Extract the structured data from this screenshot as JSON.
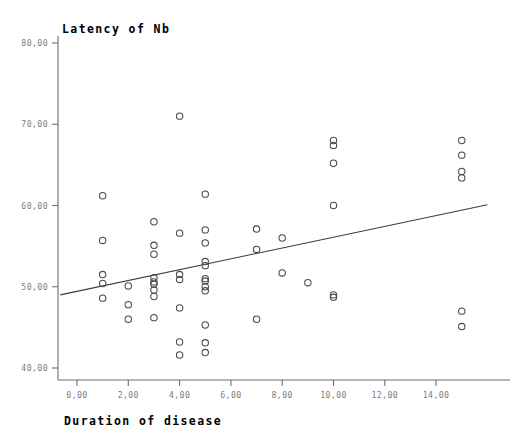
{
  "chart": {
    "type": "scatter",
    "title": "Latency of Nb",
    "xlabel": "Duration of disease",
    "ylabel": "Latency of Nb"
  },
  "chart_data": {
    "type": "scatter",
    "title": "Latency of Nb",
    "subtitle": "",
    "xlabel": "Duration of disease",
    "ylabel": "Latency of Nb",
    "xlim": [
      -0.65,
      16.0
    ],
    "ylim": [
      38.0,
      81.5
    ],
    "xticks": [
      0,
      2,
      4,
      6,
      8,
      10,
      12,
      14
    ],
    "xtick_labels": [
      "0,00",
      "2,00",
      "4,00",
      "6,00",
      "8,00",
      "10,00",
      "12,00",
      "14,00"
    ],
    "yticks": [
      40,
      50,
      60,
      70,
      80
    ],
    "ytick_labels": [
      "40,00",
      "50,00",
      "60,00",
      "70,00",
      "80,00"
    ],
    "grid": false,
    "legend": null,
    "marker": "open-circle",
    "marker_color": "#4a4a4a",
    "axis_color": "#6f6f6f",
    "tick_label_color": "#7d7d7d",
    "decimal_separator": ",",
    "series": [
      {
        "name": "Observations",
        "points": [
          [
            1,
            61.2
          ],
          [
            1,
            55.7
          ],
          [
            1,
            51.5
          ],
          [
            1,
            50.4
          ],
          [
            1,
            48.6
          ],
          [
            2,
            50.1
          ],
          [
            2,
            47.8
          ],
          [
            2,
            46.0
          ],
          [
            3,
            58.0
          ],
          [
            3,
            55.1
          ],
          [
            3,
            54.0
          ],
          [
            3,
            51.1
          ],
          [
            3,
            50.6
          ],
          [
            3,
            50.3
          ],
          [
            3,
            49.6
          ],
          [
            3,
            48.8
          ],
          [
            3,
            46.2
          ],
          [
            4,
            71.0
          ],
          [
            4,
            56.6
          ],
          [
            4,
            51.5
          ],
          [
            4,
            50.9
          ],
          [
            4,
            47.4
          ],
          [
            4,
            43.2
          ],
          [
            4,
            41.6
          ],
          [
            5,
            61.4
          ],
          [
            5,
            57.0
          ],
          [
            5,
            55.4
          ],
          [
            5,
            53.1
          ],
          [
            5,
            52.6
          ],
          [
            5,
            51.0
          ],
          [
            5,
            50.7
          ],
          [
            5,
            50.0
          ],
          [
            5,
            49.5
          ],
          [
            5,
            45.3
          ],
          [
            5,
            43.1
          ],
          [
            5,
            41.9
          ],
          [
            7,
            57.1
          ],
          [
            7,
            54.6
          ],
          [
            7,
            46.0
          ],
          [
            8,
            56.0
          ],
          [
            8,
            51.7
          ],
          [
            9,
            50.5
          ],
          [
            10,
            68.0
          ],
          [
            10,
            67.4
          ],
          [
            10,
            65.2
          ],
          [
            10,
            60.0
          ],
          [
            10,
            49.0
          ],
          [
            10,
            48.7
          ],
          [
            15,
            68.0
          ],
          [
            15,
            66.2
          ],
          [
            15,
            64.2
          ],
          [
            15,
            63.4
          ],
          [
            15,
            47.0
          ],
          [
            15,
            45.1
          ]
        ]
      }
    ],
    "fit_line": {
      "name": "Linear fit",
      "x0": -0.65,
      "y0": 49.0,
      "x1": 16.0,
      "y1": 60.1
    },
    "n_points": 54
  }
}
